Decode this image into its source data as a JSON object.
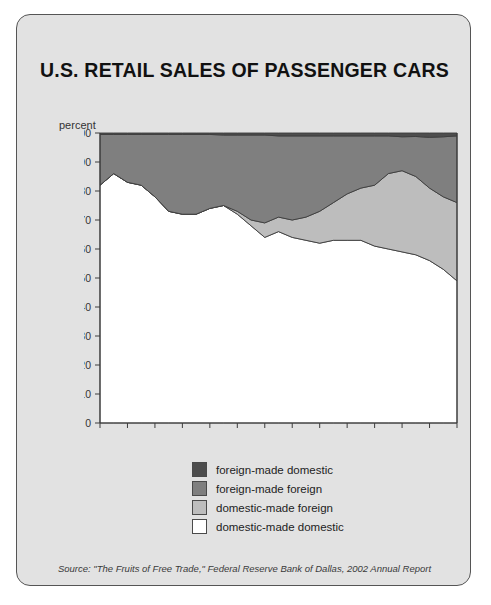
{
  "panel": {
    "title": "U.S. RETAIL SALES OF PASSENGER CARS",
    "source": "Source: \"The Fruits of Free Trade,\" Federal Reserve Bank of Dallas, 2002 Annual Report",
    "background_color": "#e2e2e2",
    "border_color": "#555555"
  },
  "chart_data": {
    "type": "area",
    "stacked": true,
    "normalized_to_percent": true,
    "title": "U.S. RETAIL SALES OF PASSENGER CARS",
    "xlabel": "",
    "ylabel": "percent",
    "ylim": [
      0,
      100
    ],
    "ytick_step": 10,
    "yticks": [
      0,
      10,
      20,
      30,
      40,
      50,
      60,
      70,
      80,
      90,
      100
    ],
    "grid": false,
    "legend_position": "below-plot-center",
    "x": [
      1975,
      1976,
      1977,
      1978,
      1979,
      1980,
      1981,
      1982,
      1983,
      1984,
      1985,
      1986,
      1987,
      1988,
      1989,
      1990,
      1991,
      1992,
      1993,
      1994,
      1995,
      1996,
      1997,
      1998,
      1999,
      2000,
      2001
    ],
    "xtick_labels": [
      "'75",
      "'77",
      "'79",
      "'81",
      "'83",
      "'85",
      "'87",
      "'89",
      "'91",
      "'93",
      "'95",
      "'97",
      "'99",
      "'01"
    ],
    "xtick_values": [
      1975,
      1977,
      1979,
      1981,
      1983,
      1985,
      1987,
      1989,
      1991,
      1993,
      1995,
      1997,
      1999,
      2001
    ],
    "series": [
      {
        "name": "domestic-made domestic",
        "color": "#ffffff",
        "stack_order": 1,
        "values": [
          82,
          86,
          83,
          82,
          78,
          73,
          72,
          72,
          74,
          75,
          72,
          68,
          64,
          66,
          64,
          63,
          62,
          63,
          63,
          63,
          61,
          60,
          59,
          58,
          56,
          53,
          49
        ]
      },
      {
        "name": "domestic-made foreign",
        "color": "#bdbdbd",
        "stack_order": 2,
        "values": [
          0,
          0,
          0,
          0,
          0,
          0,
          0,
          0,
          0,
          0,
          1,
          2,
          5,
          5,
          6,
          8,
          11,
          13,
          16,
          18,
          21,
          26,
          28,
          27,
          25,
          25,
          27
        ]
      },
      {
        "name": "foreign-made foreign",
        "color": "#7f7f7f",
        "stack_order": 3,
        "values": [
          17.5,
          13.5,
          16.5,
          17.5,
          21.5,
          26.5,
          27.5,
          27.5,
          25.5,
          24.3,
          26.3,
          29.3,
          30.3,
          28.0,
          29.0,
          28.0,
          26.0,
          23.0,
          20.0,
          18.0,
          17.0,
          13.0,
          11.7,
          13.8,
          17.5,
          20.7,
          23.0
        ]
      },
      {
        "name": "foreign-made domestic",
        "color": "#4d4d4d",
        "stack_order": 4,
        "values": [
          0.5,
          0.5,
          0.5,
          0.5,
          0.5,
          0.5,
          0.5,
          0.5,
          0.5,
          0.7,
          0.7,
          0.7,
          0.7,
          1.0,
          1.0,
          1.0,
          1.0,
          1.0,
          1.0,
          1.0,
          1.0,
          1.0,
          1.3,
          1.2,
          1.5,
          1.3,
          1.0
        ]
      }
    ],
    "legend": [
      {
        "label": "foreign-made domestic",
        "color": "#4d4d4d"
      },
      {
        "label": "foreign-made foreign",
        "color": "#7f7f7f"
      },
      {
        "label": "domestic-made foreign",
        "color": "#bdbdbd"
      },
      {
        "label": "domestic-made domestic",
        "color": "#ffffff"
      }
    ]
  }
}
